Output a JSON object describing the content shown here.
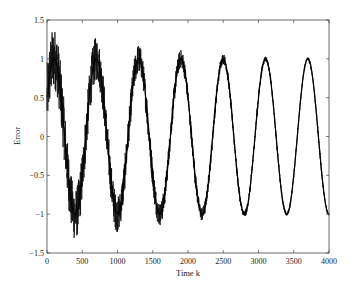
{
  "chart_data": {
    "type": "line",
    "title": "",
    "xlabel": "Time k",
    "ylabel": "Error",
    "xlim": [
      0,
      4000
    ],
    "ylim": [
      -1.5,
      1.5
    ],
    "xticks": [
      0,
      500,
      1000,
      1500,
      2000,
      2500,
      3000,
      3500,
      4000
    ],
    "yticks": [
      1.5,
      1,
      0.5,
      0,
      -0.5,
      -1,
      -1.5
    ],
    "xtick_labels": [
      "0",
      "500",
      "1000",
      "1500",
      "2000",
      "2500",
      "3000",
      "3500",
      "4000"
    ],
    "ytick_labels": [
      "1.5",
      "1",
      "0.5",
      "0",
      "-0.5",
      "-1",
      "-1.5"
    ],
    "grid": false,
    "legend": null,
    "series": [
      {
        "name": "Error",
        "description": "Noisy sinusoid, period ~600 samples, amplitude ~1; noise decays over time",
        "color": "#111111",
        "period": 600,
        "amplitude": 1.0,
        "phase_peak_k": 100,
        "noise_start": 0.4,
        "noise_end": 0.02,
        "peaks_k": [
          100,
          700,
          1300,
          1900,
          2500,
          3100,
          3650
        ],
        "troughs_k": [
          400,
          1000,
          1600,
          2200,
          2800,
          3400,
          3950
        ],
        "x": [
          0,
          100,
          250,
          400,
          550,
          700,
          850,
          1000,
          1150,
          1300,
          1450,
          1600,
          1750,
          1900,
          2050,
          2200,
          2350,
          2500,
          2650,
          2800,
          2950,
          3100,
          3250,
          3400,
          3550,
          3700,
          3850,
          4000
        ],
        "y": [
          0.0,
          1.0,
          0.0,
          -1.0,
          0.0,
          1.0,
          0.0,
          -1.0,
          0.0,
          1.0,
          0.0,
          -1.0,
          0.0,
          1.0,
          0.0,
          -1.0,
          0.0,
          1.0,
          0.0,
          -1.0,
          0.0,
          1.0,
          0.0,
          -1.0,
          0.0,
          1.0,
          0.0,
          -0.87
        ]
      }
    ]
  }
}
